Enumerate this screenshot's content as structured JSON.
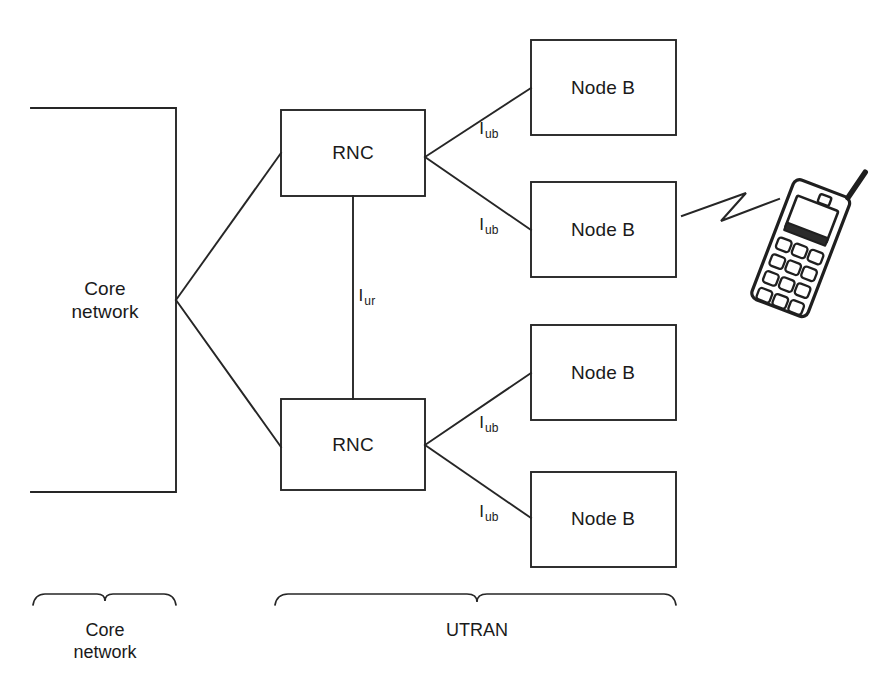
{
  "diagram": {
    "stroke_color": "#262626",
    "background_color": "#ffffff",
    "nodes": [
      {
        "id": "core-network",
        "label": "Core\nnetwork",
        "shape": "open-box",
        "x": 31,
        "y": 108,
        "w": 145,
        "h": 384,
        "label_x": 105,
        "label_y": 300
      },
      {
        "id": "rnc-top",
        "label": "RNC",
        "shape": "box",
        "x": 281,
        "y": 110,
        "w": 144,
        "h": 86,
        "label_x": 353,
        "label_y": 153
      },
      {
        "id": "rnc-bottom",
        "label": "RNC",
        "shape": "box",
        "x": 281,
        "y": 399,
        "w": 144,
        "h": 91,
        "label_x": 353,
        "label_y": 445
      },
      {
        "id": "node-b-1",
        "label": "Node B",
        "shape": "box",
        "x": 531,
        "y": 40,
        "w": 145,
        "h": 95,
        "label_x": 603,
        "label_y": 88
      },
      {
        "id": "node-b-2",
        "label": "Node B",
        "shape": "box",
        "x": 531,
        "y": 182,
        "w": 145,
        "h": 95,
        "label_x": 603,
        "label_y": 230
      },
      {
        "id": "node-b-3",
        "label": "Node B",
        "shape": "box",
        "x": 531,
        "y": 325,
        "w": 145,
        "h": 95,
        "label_x": 603,
        "label_y": 373
      },
      {
        "id": "node-b-4",
        "label": "Node B",
        "shape": "box",
        "x": 531,
        "y": 472,
        "w": 145,
        "h": 95,
        "label_x": 603,
        "label_y": 519
      }
    ],
    "interface_labels": [
      {
        "id": "iub-1",
        "base": "I",
        "sub": "ub",
        "x": 489,
        "y": 130
      },
      {
        "id": "iub-2",
        "base": "I",
        "sub": "ub",
        "x": 489,
        "y": 226
      },
      {
        "id": "iur",
        "base": "I",
        "sub": "ur",
        "x": 367,
        "y": 297
      },
      {
        "id": "iub-3",
        "base": "I",
        "sub": "ub",
        "x": 489,
        "y": 424
      },
      {
        "id": "iub-4",
        "base": "I",
        "sub": "ub",
        "x": 489,
        "y": 513
      }
    ],
    "links": [
      {
        "id": "core-to-rnc-top",
        "from": "core-network",
        "to": "rnc-top"
      },
      {
        "id": "core-to-rnc-bottom",
        "from": "core-network",
        "to": "rnc-bottom"
      },
      {
        "id": "rnc-top-to-node-b-1",
        "from": "rnc-top",
        "to": "node-b-1",
        "interface": "Iub"
      },
      {
        "id": "rnc-top-to-node-b-2",
        "from": "rnc-top",
        "to": "node-b-2",
        "interface": "Iub"
      },
      {
        "id": "rnc-top-to-rnc-bottom",
        "from": "rnc-top",
        "to": "rnc-bottom",
        "interface": "Iur"
      },
      {
        "id": "rnc-bottom-to-node-b-3",
        "from": "rnc-bottom",
        "to": "node-b-3",
        "interface": "Iub"
      },
      {
        "id": "rnc-bottom-to-node-b-4",
        "from": "rnc-bottom",
        "to": "node-b-4",
        "interface": "Iub"
      },
      {
        "id": "node-b-2-to-handset",
        "from": "node-b-2",
        "to": "mobile-handset",
        "style": "radio-link"
      }
    ],
    "braces": [
      {
        "id": "brace-core-network",
        "label": "Core\nnetwork",
        "x1": 33,
        "x2": 176,
        "y": 605,
        "label_x": 105,
        "label_y": 620
      },
      {
        "id": "brace-utran",
        "label": "UTRAN",
        "x1": 275,
        "x2": 676,
        "y": 605,
        "label_x": 477,
        "label_y": 620
      }
    ],
    "handset": {
      "id": "mobile-handset",
      "name": "mobile-phone-illustration",
      "keypad_rows": 4,
      "keypad_cols": 3
    }
  }
}
